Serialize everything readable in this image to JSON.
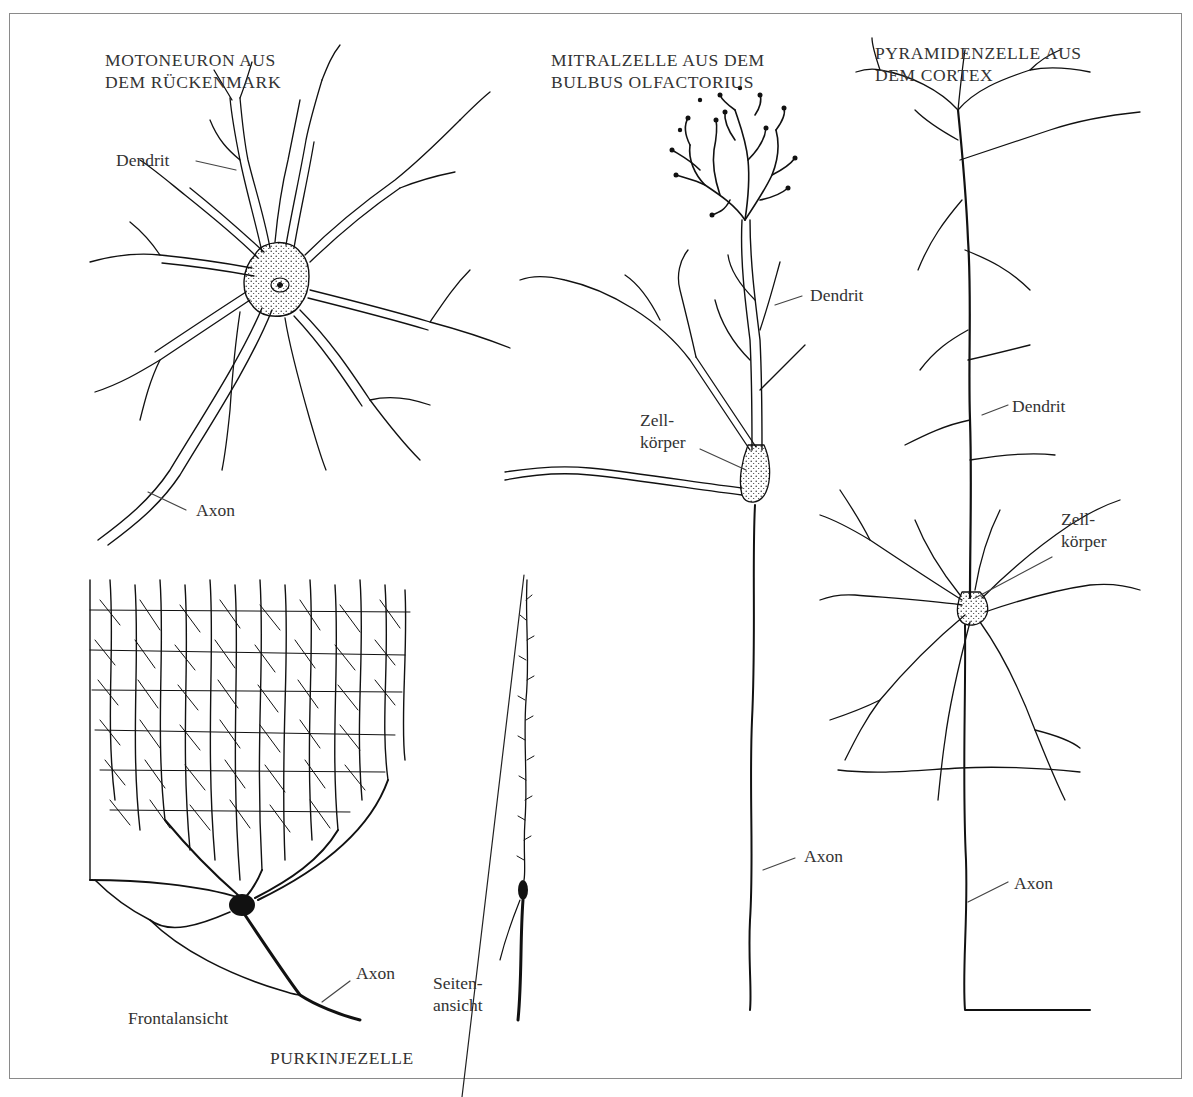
{
  "figure": {
    "frame_color": "#8a8a8a",
    "ink_color": "#111111",
    "background": "#ffffff"
  },
  "cells": {
    "motoneuron": {
      "title_line1": "MOTONEURON AUS",
      "title_line2": "DEM RÜCKENMARK",
      "labels": {
        "dendrit": "Dendrit",
        "axon": "Axon"
      }
    },
    "mitral": {
      "title_line1": "MITRALZELLE AUS DEM",
      "title_line2": "BULBUS OLFACTORIUS",
      "labels": {
        "dendrit": "Dendrit",
        "zellkoerper_line1": "Zell-",
        "zellkoerper_line2": "körper",
        "axon": "Axon"
      }
    },
    "pyramidal": {
      "title_line1": "PYRAMIDENZELLE AUS",
      "title_line2": "DEM CORTEX",
      "labels": {
        "dendrit": "Dendrit",
        "zellkoerper_line1": "Zell-",
        "zellkoerper_line2": "körper",
        "axon": "Axon"
      }
    },
    "purkinje": {
      "title": "PURKINJEZELLE",
      "labels": {
        "frontal": "Frontalansicht",
        "axon": "Axon",
        "side_line1": "Seiten-",
        "side_line2": "ansicht"
      }
    }
  }
}
